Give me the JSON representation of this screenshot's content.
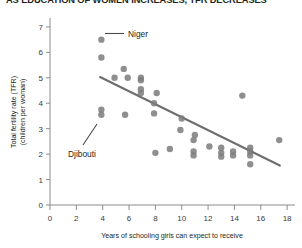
{
  "chart_data": {
    "type": "scatter",
    "title": "AS EDUCATION OF WOMEN INCREASES, TFR DECREASES",
    "xlabel": "Years of schooling girls can expect to receive",
    "ylabel_line1": "Total fertility rate (TFR)",
    "ylabel_line2": "(children per woman)",
    "xlim": [
      0,
      18.6
    ],
    "ylim": [
      0,
      7.35
    ],
    "xticks": [
      0,
      2,
      4,
      6,
      8,
      10,
      12,
      14,
      16,
      18
    ],
    "yticks": [
      0,
      1,
      2,
      3,
      4,
      5,
      6,
      7
    ],
    "grid": false,
    "legend": "none",
    "point_color": "#7b7b7b",
    "line_color": "#6e6e6e",
    "axis_color": "#8c8c8c",
    "points": [
      {
        "x": 3.9,
        "y": 6.5
      },
      {
        "x": 3.9,
        "y": 5.8
      },
      {
        "x": 5.6,
        "y": 5.35
      },
      {
        "x": 6.9,
        "y": 5.0
      },
      {
        "x": 4.9,
        "y": 5.0
      },
      {
        "x": 5.9,
        "y": 5.0
      },
      {
        "x": 6.9,
        "y": 4.9
      },
      {
        "x": 6.9,
        "y": 4.55
      },
      {
        "x": 6.9,
        "y": 4.4
      },
      {
        "x": 8.1,
        "y": 4.4
      },
      {
        "x": 7.9,
        "y": 4.0
      },
      {
        "x": 7.9,
        "y": 3.6
      },
      {
        "x": 3.9,
        "y": 3.75
      },
      {
        "x": 3.9,
        "y": 3.55
      },
      {
        "x": 5.7,
        "y": 3.55
      },
      {
        "x": 10.0,
        "y": 3.4
      },
      {
        "x": 9.9,
        "y": 2.95
      },
      {
        "x": 11.0,
        "y": 2.75
      },
      {
        "x": 10.9,
        "y": 2.55
      },
      {
        "x": 14.6,
        "y": 4.3
      },
      {
        "x": 8.0,
        "y": 2.05
      },
      {
        "x": 9.1,
        "y": 2.2
      },
      {
        "x": 10.9,
        "y": 2.1
      },
      {
        "x": 10.9,
        "y": 1.95
      },
      {
        "x": 13.0,
        "y": 2.25
      },
      {
        "x": 13.0,
        "y": 2.05
      },
      {
        "x": 13.0,
        "y": 1.9
      },
      {
        "x": 13.9,
        "y": 2.1
      },
      {
        "x": 13.9,
        "y": 1.95
      },
      {
        "x": 15.2,
        "y": 2.25
      },
      {
        "x": 15.2,
        "y": 2.1
      },
      {
        "x": 15.2,
        "y": 1.95
      },
      {
        "x": 15.2,
        "y": 1.6
      },
      {
        "x": 17.4,
        "y": 2.55
      },
      {
        "x": 12.1,
        "y": 2.3
      }
    ],
    "trendline": {
      "x1": 3.8,
      "y1": 5.03,
      "x2": 17.45,
      "y2": 1.55
    },
    "annotations": [
      {
        "label": "Niger",
        "x": 3.9,
        "y": 6.5
      },
      {
        "label": "Djibouti",
        "x": 3.9,
        "y": 3.65
      }
    ]
  }
}
